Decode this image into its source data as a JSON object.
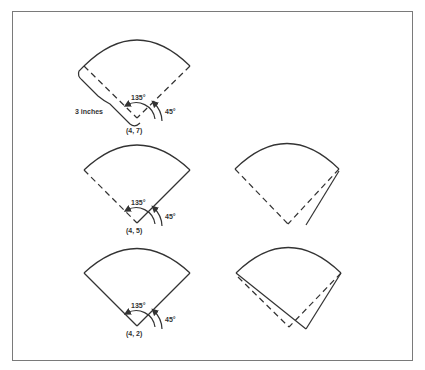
{
  "figure": {
    "type": "geometric diagram",
    "panels": [
      {
        "id": "top-left",
        "apex_label": "(4, 7)",
        "angle_large": "135°",
        "angle_small": "45°",
        "dimension_label": "3 inches",
        "left_edge": "dashed",
        "right_edge": "dashed"
      },
      {
        "id": "middle-left",
        "apex_label": "(4, 5)",
        "angle_large": "135°",
        "angle_small": "45°",
        "left_edge": "dashed",
        "right_edge": "solid"
      },
      {
        "id": "middle-right",
        "left_edge": "dashed",
        "right_edge": "dashed",
        "extra": "solid line offset from right edge"
      },
      {
        "id": "bottom-left",
        "apex_label": "(4, 2)",
        "angle_large": "135°",
        "angle_small": "45°",
        "left_edge": "solid",
        "right_edge": "solid"
      },
      {
        "id": "bottom-right",
        "left_edge": "dashed + solid",
        "right_edge": "dashed + solid",
        "extra": "two overlapping sector outlines (dashed and solid) with shifted apexes"
      }
    ]
  },
  "labels": {
    "p1_apex": "(4, 7)",
    "p1_a135": "135°",
    "p1_a45": "45°",
    "p1_dim": "3 inches",
    "p2_apex": "(4, 5)",
    "p2_a135": "135°",
    "p2_a45": "45°",
    "p4_apex": "(4, 2)",
    "p4_a135": "135°",
    "p4_a45": "45°"
  },
  "colors": {
    "line": "#333333",
    "frame": "#7a7a7a",
    "background": "#ffffff"
  }
}
